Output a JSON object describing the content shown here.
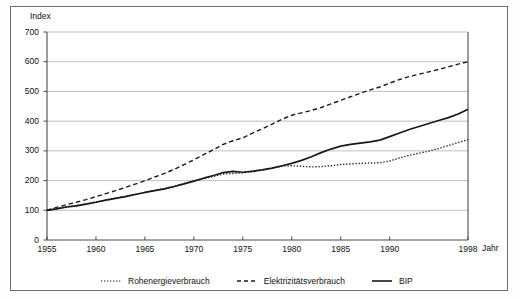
{
  "axis": {
    "y_title": "Index",
    "x_title": "Jahr"
  },
  "yticks": [
    "0",
    "100",
    "200",
    "300",
    "400",
    "500",
    "600",
    "700"
  ],
  "xticks": [
    "1955",
    "1960",
    "1965",
    "1970",
    "1975",
    "1980",
    "1985",
    "1990",
    "1998"
  ],
  "legend": {
    "items": [
      {
        "label": "Rohenergieverbrauch",
        "style": "dotted",
        "color": "#1a1a1a"
      },
      {
        "label": "Elektrizitätsverbrauch",
        "style": "dashed",
        "color": "#1a1a1a"
      },
      {
        "label": "BIP",
        "style": "solid",
        "color": "#1a1a1a"
      }
    ]
  },
  "colors": {
    "line": "#1a1a1a",
    "grid": "#b9b9b9",
    "axis": "#4a4a4a",
    "frame": "#6e6e6e"
  },
  "chart_data": {
    "type": "line",
    "title": "",
    "subtitle": "",
    "xlabel": "Jahr",
    "ylabel": "Index",
    "xlim": [
      1955,
      1998
    ],
    "ylim": [
      0,
      700
    ],
    "ytick_values": [
      0,
      100,
      200,
      300,
      400,
      500,
      600,
      700
    ],
    "xtick_values": [
      1955,
      1960,
      1965,
      1970,
      1975,
      1980,
      1985,
      1990,
      1998
    ],
    "grid": "horizontal",
    "legend_position": "bottom",
    "x": [
      1955,
      1956,
      1957,
      1958,
      1959,
      1960,
      1961,
      1962,
      1963,
      1964,
      1965,
      1966,
      1967,
      1968,
      1969,
      1970,
      1971,
      1972,
      1973,
      1974,
      1975,
      1976,
      1977,
      1978,
      1979,
      1980,
      1981,
      1982,
      1983,
      1984,
      1985,
      1986,
      1987,
      1988,
      1989,
      1990,
      1991,
      1992,
      1993,
      1994,
      1995,
      1996,
      1997,
      1998
    ],
    "series": [
      {
        "name": "Rohenergieverbrauch",
        "style": "dotted",
        "values": [
          100,
          106,
          112,
          116,
          122,
          128,
          134,
          141,
          147,
          154,
          160,
          167,
          173,
          181,
          190,
          199,
          207,
          214,
          222,
          224,
          226,
          233,
          236,
          242,
          248,
          250,
          248,
          246,
          247,
          250,
          254,
          256,
          258,
          259,
          260,
          266,
          276,
          285,
          292,
          299,
          308,
          318,
          328,
          338
        ]
      },
      {
        "name": "Elektrizitätsverbrauch",
        "style": "dashed",
        "values": [
          100,
          110,
          119,
          127,
          136,
          146,
          156,
          166,
          177,
          188,
          199,
          212,
          224,
          238,
          254,
          270,
          287,
          304,
          322,
          334,
          344,
          360,
          374,
          390,
          406,
          420,
          428,
          436,
          446,
          458,
          470,
          482,
          494,
          505,
          515,
          528,
          540,
          550,
          558,
          566,
          574,
          583,
          592,
          600
        ]
      },
      {
        "name": "BIP",
        "style": "solid",
        "values": [
          100,
          105,
          111,
          115,
          121,
          127,
          134,
          140,
          146,
          153,
          160,
          166,
          172,
          180,
          189,
          198,
          208,
          217,
          227,
          231,
          228,
          231,
          236,
          242,
          250,
          258,
          268,
          280,
          294,
          306,
          316,
          322,
          326,
          330,
          336,
          348,
          360,
          372,
          382,
          392,
          402,
          412,
          424,
          440
        ]
      }
    ]
  }
}
